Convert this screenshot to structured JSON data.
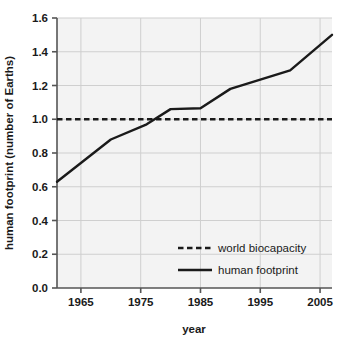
{
  "chart_data": {
    "type": "line",
    "title": "",
    "xlabel": "year",
    "ylabel": "human footprint (number of Earths)",
    "xlim": [
      1961,
      2007
    ],
    "ylim": [
      0.0,
      1.6
    ],
    "xticks": [
      "1965",
      "1975",
      "1985",
      "1995",
      "2005"
    ],
    "xtick_values": [
      1965,
      1975,
      1985,
      1995,
      2005
    ],
    "yticks": [
      "0.0",
      "0.2",
      "0.4",
      "0.6",
      "0.8",
      "1.0",
      "1.2",
      "1.4",
      "1.6"
    ],
    "ytick_values": [
      0.0,
      0.2,
      0.4,
      0.6,
      0.8,
      1.0,
      1.2,
      1.4,
      1.6
    ],
    "grid": true,
    "legend_position": "lower right",
    "series": [
      {
        "name": "human footprint",
        "style": "solid",
        "color": "#1a1a1a",
        "x": [
          1961,
          1970,
          1976,
          1980,
          1985,
          1990,
          2000,
          2007
        ],
        "values": [
          0.63,
          0.88,
          0.97,
          1.06,
          1.065,
          1.18,
          1.29,
          1.5
        ]
      },
      {
        "name": "world biocapacity",
        "style": "dashed",
        "color": "#1a1a1a",
        "x": [
          1961,
          2007
        ],
        "values": [
          1.0,
          1.0
        ]
      }
    ],
    "legend": [
      {
        "label": "world biocapacity",
        "style": "dashed"
      },
      {
        "label": "human footprint",
        "style": "solid"
      }
    ],
    "plot_background": "#f3f3f3",
    "grid_color": "#cfcfcf",
    "axis_color": "#555555"
  }
}
